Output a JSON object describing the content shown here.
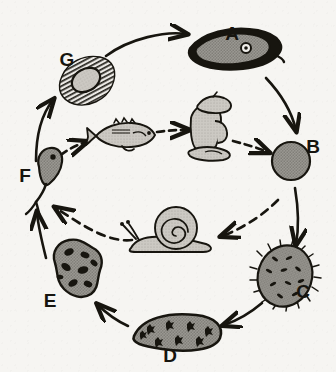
{
  "diagram": {
    "background_color": "#f6f5f2",
    "ink_color": "#17150f",
    "fill_gray": "#8e8c86",
    "fill_light": "#c9c7c1",
    "stages": [
      {
        "id": "A",
        "label": "A",
        "name": "adult-fluke",
        "description": "dark elongated leaf-shaped adult fluke with oral sucker",
        "label_x": 232,
        "label_y": 40
      },
      {
        "id": "B",
        "label": "B",
        "name": "egg",
        "description": "round stippled egg",
        "label_x": 313,
        "label_y": 153
      },
      {
        "id": "C",
        "label": "C",
        "name": "miracidium",
        "description": "ciliated oval miracidium with dark flecks",
        "label_x": 303,
        "label_y": 298
      },
      {
        "id": "D",
        "label": "D",
        "name": "sporocyst",
        "description": "elongated sausage-shaped sporocyst with dark cross flecks",
        "label_x": 170,
        "label_y": 360
      },
      {
        "id": "E",
        "label": "E",
        "name": "redia",
        "description": "irregular blob redia with dark internal germ balls",
        "label_x": 50,
        "label_y": 305
      },
      {
        "id": "F",
        "label": "F",
        "name": "cercaria",
        "description": "tadpole-like cercaria with forked tail",
        "label_x": 27,
        "label_y": 181
      },
      {
        "id": "G",
        "label": "G",
        "name": "metacercaria-in-tissue",
        "description": "hatched tissue cyst enclosing an oval metacercaria",
        "label_x": 67,
        "label_y": 65
      }
    ],
    "hosts": [
      {
        "name": "fish-host",
        "description": "freshwater fish facing right"
      },
      {
        "name": "human-host",
        "description": "person in conical hat kneeling, facing right"
      },
      {
        "name": "snail-host",
        "description": "snail with spiral shell facing left"
      }
    ],
    "arrows": [
      {
        "name": "arrow-g-to-a",
        "style": "solid"
      },
      {
        "name": "arrow-a-to-b",
        "style": "solid"
      },
      {
        "name": "arrow-b-to-c",
        "style": "solid"
      },
      {
        "name": "arrow-c-to-d",
        "style": "solid"
      },
      {
        "name": "arrow-d-to-e",
        "style": "solid"
      },
      {
        "name": "arrow-e-to-f",
        "style": "solid"
      },
      {
        "name": "arrow-f-to-g",
        "style": "solid"
      },
      {
        "name": "arrow-b-to-snail",
        "style": "dashed"
      },
      {
        "name": "arrow-snail-to-f",
        "style": "dashed"
      },
      {
        "name": "arrow-f-to-fish",
        "style": "dashed"
      },
      {
        "name": "arrow-fish-to-human",
        "style": "dashed"
      },
      {
        "name": "arrow-human-to-b",
        "style": "dashed"
      }
    ]
  }
}
